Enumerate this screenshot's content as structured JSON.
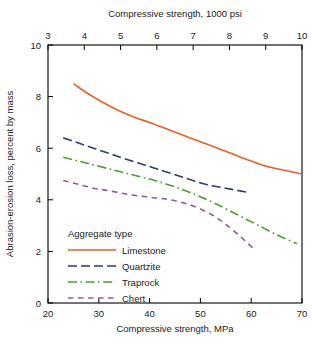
{
  "chart_data": {
    "type": "line",
    "title": "",
    "xlabel": "Compressive strength, MPa",
    "xlabel_top": "Compressive strength, 1000 psi",
    "ylabel": "Abrasion-erosion loss, percent by mass",
    "xlim": [
      20,
      70
    ],
    "ylim": [
      0,
      10
    ],
    "xlim_top": [
      3,
      10
    ],
    "xticks": [
      20,
      30,
      40,
      50,
      60,
      70
    ],
    "xticks_top": [
      3,
      4,
      5,
      6,
      7,
      8,
      9,
      10
    ],
    "yticks": [
      0,
      2,
      4,
      6,
      8,
      10
    ],
    "grid": false,
    "legend_position": "lower-left-inside",
    "legend_title": "Aggregate type",
    "series": [
      {
        "name": "Limestone",
        "color": "#E8602C",
        "dash": "solid",
        "x": [
          25.0,
          28.0,
          31.0,
          34.0,
          37.0,
          40.0,
          44.0,
          48.0,
          52.0,
          56.0,
          60.0,
          64.0,
          70.0
        ],
        "y": [
          8.5,
          8.1,
          7.75,
          7.45,
          7.2,
          7.0,
          6.7,
          6.4,
          6.1,
          5.8,
          5.5,
          5.25,
          5.0
        ]
      },
      {
        "name": "Quartzite",
        "color": "#2E3B6B",
        "dash": "dash-long",
        "x": [
          23.0,
          26.0,
          29.0,
          32.0,
          35.0,
          39.0,
          43.0,
          47.0,
          51.0,
          55.0,
          59.0
        ],
        "y": [
          6.4,
          6.2,
          6.0,
          5.8,
          5.6,
          5.35,
          5.1,
          4.85,
          4.6,
          4.45,
          4.3
        ]
      },
      {
        "name": "Traprock",
        "color": "#4E9A2F",
        "dash": "dash-dot",
        "x": [
          23.0,
          26.0,
          29.0,
          33.0,
          37.0,
          41.0,
          45.0,
          49.0,
          53.0,
          57.0,
          61.0,
          65.0,
          69.0
        ],
        "y": [
          5.65,
          5.5,
          5.35,
          5.15,
          4.95,
          4.75,
          4.5,
          4.2,
          3.85,
          3.45,
          3.05,
          2.65,
          2.3
        ]
      },
      {
        "name": "Chert",
        "color": "#8B5F8E",
        "dash": "dash-short",
        "x": [
          23.0,
          26.0,
          29.0,
          32.0,
          36.0,
          40.0,
          44.0,
          48.0,
          52.0,
          55.0,
          58.0,
          60.5
        ],
        "y": [
          4.75,
          4.6,
          4.45,
          4.35,
          4.2,
          4.1,
          4.0,
          3.8,
          3.45,
          3.05,
          2.55,
          2.1
        ]
      }
    ]
  }
}
